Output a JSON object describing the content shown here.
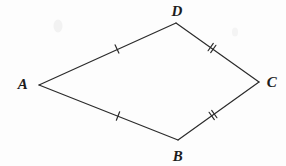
{
  "figure": {
    "type": "geometry-diagram",
    "shape_name": "quadrilateral ABCD",
    "width": 286,
    "height": 166,
    "background_color": "#fdfdfd",
    "stroke_color": "#2b2b2b",
    "stroke_width": 1.2,
    "label_color": "#1c1c1c"
  },
  "vertices": [
    {
      "id": "A",
      "label": "A",
      "x": 39,
      "y": 85,
      "label_x": 23,
      "label_y": 84
    },
    {
      "id": "D",
      "label": "D",
      "x": 176,
      "y": 23,
      "label_x": 177,
      "label_y": 11
    },
    {
      "id": "C",
      "label": "C",
      "x": 259,
      "y": 82,
      "label_x": 272,
      "label_y": 82
    },
    {
      "id": "B",
      "label": "B",
      "x": 178,
      "y": 140,
      "label_x": 178,
      "label_y": 156
    }
  ],
  "sides": [
    {
      "id": "AD",
      "from": "A",
      "to": "D",
      "x1": 39,
      "y1": 85,
      "x2": 176,
      "y2": 23,
      "tick_count": 1,
      "tick_x": 117,
      "tick_y": 49
    },
    {
      "id": "DC",
      "from": "D",
      "to": "C",
      "x1": 176,
      "y1": 23,
      "x2": 259,
      "y2": 82,
      "tick_count": 2,
      "tick_x": 212,
      "tick_y": 48
    },
    {
      "id": "CB",
      "from": "C",
      "to": "B",
      "x1": 259,
      "y1": 82,
      "x2": 178,
      "y2": 140,
      "tick_count": 2,
      "tick_x": 213,
      "tick_y": 115
    },
    {
      "id": "BA",
      "from": "B",
      "to": "A",
      "x1": 178,
      "y1": 140,
      "x2": 39,
      "y2": 85,
      "tick_count": 1,
      "tick_x": 118,
      "tick_y": 116
    }
  ],
  "tick_style": {
    "length": 9,
    "double_gap": 3.2,
    "color": "#2b2b2b",
    "width": 1.2
  },
  "artifacts": [
    {
      "id": "smudge-left",
      "x": 58,
      "y": 26,
      "w": 9,
      "h": 13,
      "color": "#f2f2f2"
    },
    {
      "id": "smudge-right",
      "x": 235,
      "y": 32,
      "w": 6,
      "h": 9,
      "color": "#f4f4f4"
    }
  ]
}
